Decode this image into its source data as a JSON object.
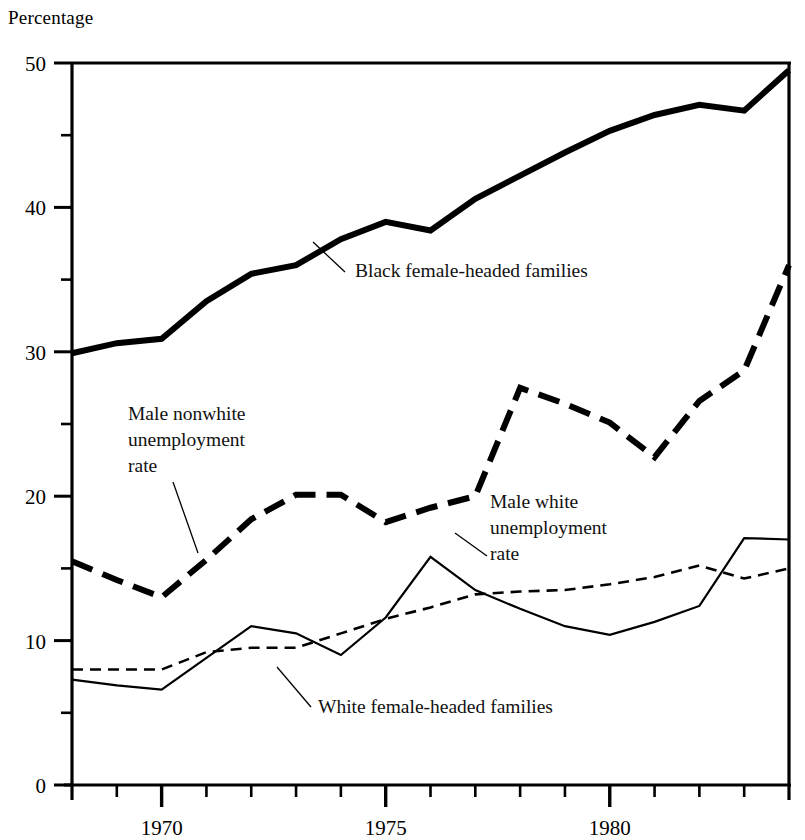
{
  "chart_data": {
    "type": "line",
    "title": "",
    "ylabel": "Percentage",
    "xlabel": "",
    "ylim": [
      0,
      50
    ],
    "xlim": [
      1968,
      1984
    ],
    "grid": false,
    "legend_position": "inline-annotations",
    "y_major_ticks": [
      0,
      10,
      20,
      30,
      40,
      50
    ],
    "y_minor_ticks": [
      5,
      15,
      25,
      35,
      45
    ],
    "y_tick_labels": [
      "0",
      "10",
      "20",
      "30",
      "40",
      "50"
    ],
    "x_major_ticks": [
      1970,
      1975,
      1980
    ],
    "x_tick_labels": [
      "1970",
      "1975",
      "1980"
    ],
    "x_minor_ticks": [
      1969,
      1971,
      1972,
      1973,
      1974,
      1976,
      1977,
      1978,
      1979,
      1981,
      1982,
      1983
    ],
    "x": [
      1968,
      1969,
      1970,
      1971,
      1972,
      1973,
      1974,
      1975,
      1976,
      1977,
      1978,
      1979,
      1980,
      1981,
      1982,
      1983,
      1984
    ],
    "series": [
      {
        "name": "Black female-headed families",
        "style": "thick-solid",
        "values": [
          29.9,
          30.6,
          30.9,
          33.5,
          35.4,
          36.0,
          37.8,
          39.0,
          38.4,
          40.6,
          42.2,
          43.8,
          45.3,
          46.4,
          47.1,
          46.7,
          49.5
        ]
      },
      {
        "name": "Male nonwhite unemployment rate",
        "style": "thick-dashed",
        "values": [
          15.5,
          14.2,
          13.0,
          15.6,
          18.4,
          20.1,
          20.1,
          18.2,
          19.2,
          20.0,
          27.5,
          26.4,
          25.1,
          22.7,
          26.6,
          28.7,
          36.0
        ]
      },
      {
        "name": "Male white unemployment rate",
        "style": "thin-solid",
        "values": [
          7.3,
          6.9,
          6.6,
          8.8,
          11.0,
          10.5,
          9.0,
          11.6,
          15.8,
          13.5,
          12.2,
          11.0,
          10.4,
          11.3,
          12.4,
          17.1,
          17.0
        ]
      },
      {
        "name": "White female-headed families",
        "style": "thin-dashed",
        "values": [
          8.0,
          8.0,
          8.0,
          9.2,
          9.5,
          9.5,
          10.5,
          11.5,
          12.3,
          13.2,
          13.4,
          13.5,
          13.9,
          14.4,
          15.2,
          14.3,
          15.0
        ]
      }
    ],
    "annotations": [
      {
        "name": "black-female-headed-families",
        "lines": [
          "Black female-headed families"
        ],
        "text_x": 355,
        "text_y": 277,
        "leader": [
          [
            345,
            272
          ],
          [
            313,
            242
          ]
        ]
      },
      {
        "name": "male-nonwhite-unemployment-rate",
        "lines": [
          "Male nonwhite",
          "unemployment",
          "rate"
        ],
        "text_x": 128,
        "text_y": 420,
        "leader": [
          [
            173,
            482
          ],
          [
            198,
            553
          ]
        ]
      },
      {
        "name": "male-white-unemployment-rate",
        "lines": [
          "Male white",
          "unemployment",
          "rate"
        ],
        "text_x": 490,
        "text_y": 508,
        "leader": [
          [
            487,
            556
          ],
          [
            455,
            533
          ]
        ]
      },
      {
        "name": "white-female-headed-families",
        "lines": [
          "White female-headed families"
        ],
        "text_x": 318,
        "text_y": 713,
        "leader": [
          [
            311,
            707
          ],
          [
            277,
            667
          ]
        ]
      }
    ]
  }
}
